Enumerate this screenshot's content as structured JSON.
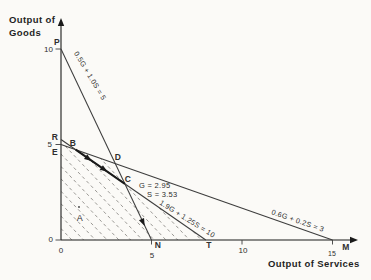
{
  "chart_data": {
    "type": "line",
    "title": "",
    "xlabel": "Output of Services",
    "ylabel_line1": "Output of",
    "ylabel_line2": "Goods",
    "xlim": [
      0,
      16
    ],
    "ylim": [
      0,
      11.5
    ],
    "x_ticks": [
      0,
      5,
      10,
      15
    ],
    "y_ticks": [
      0,
      5,
      10
    ],
    "grid": false,
    "constraint_lines": [
      {
        "name": "line-PN",
        "label": "0.5G + 1.0S = 5",
        "points": [
          [
            0,
            10
          ],
          [
            5,
            0
          ]
        ],
        "endpoint_labels": [
          "P",
          "N"
        ]
      },
      {
        "name": "line-RT",
        "label": "1.9G + 1.25S = 10",
        "points": [
          [
            0,
            5.263
          ],
          [
            8,
            0
          ]
        ],
        "endpoint_labels": [
          "R",
          "T"
        ]
      },
      {
        "name": "line-EM",
        "label": "0.6G + 0.2S = 3",
        "points": [
          [
            0,
            5
          ],
          [
            15,
            0
          ]
        ],
        "endpoint_labels": [
          "E",
          "M"
        ]
      }
    ],
    "key_points": [
      {
        "label": "P",
        "S": 0,
        "G": 10
      },
      {
        "label": "R",
        "S": 0,
        "G": 5.26
      },
      {
        "label": "E",
        "S": 0,
        "G": 5
      },
      {
        "label": "B",
        "S": 0.81,
        "G": 4.73
      },
      {
        "label": "D",
        "S": 3,
        "G": 4
      },
      {
        "label": "C",
        "S": 3.53,
        "G": 2.94,
        "note": "optimum"
      },
      {
        "label": "A",
        "S": 1.0,
        "G": 1.75
      },
      {
        "label": "N",
        "S": 5,
        "G": 0
      },
      {
        "label": "T",
        "S": 8,
        "G": 0
      },
      {
        "label": "M",
        "S": 15,
        "G": 0
      }
    ],
    "optimum_annotation": [
      "G = 2.95",
      "S = 3.53"
    ],
    "iso_profit_lines": {
      "slope": -1,
      "intercepts": [
        0.6,
        1.25,
        1.9,
        2.55,
        3.2,
        3.85,
        4.5,
        5.15,
        5.8,
        6.45,
        7.1,
        7.75
      ],
      "clip_region": [
        [
          0,
          5
        ],
        [
          3,
          4
        ],
        [
          3.53,
          2.94
        ],
        [
          8,
          0
        ],
        [
          0,
          0
        ]
      ]
    },
    "bold_segment": {
      "from": [
        0.81,
        4.73
      ],
      "to": [
        3.53,
        2.94
      ]
    }
  },
  "layout": {
    "width": 371,
    "height": 280,
    "colors": {
      "bg": "#fbfaf7",
      "ink": "#3d3d3d",
      "bold_ink": "#1a1a1a",
      "dash": "#8f8d89"
    },
    "origin": [
      61,
      240
    ],
    "scale": [
      18.1,
      19.1
    ],
    "axis_end": {
      "x": 351,
      "y": 25
    },
    "y_tick_entries": [
      {
        "label": "10",
        "G": 10,
        "lx": 53,
        "ly": 52
      },
      {
        "label": "5",
        "G": 5,
        "lx": 52,
        "ly": 147
      },
      {
        "label": "0",
        "G": 0,
        "lx": 53,
        "ly": 242
      }
    ],
    "x_tick_entries": [
      {
        "label": "0",
        "S": 0,
        "lx": 61,
        "ly": 253,
        "tick": false,
        "s": 8
      },
      {
        "label": "5",
        "S": 5,
        "lx": 152,
        "ly": 258,
        "tick": true,
        "s": 8
      },
      {
        "label": "10",
        "S": 10,
        "lx": 243,
        "ly": 253,
        "tick": true,
        "s": 8
      },
      {
        "label": "15",
        "S": 15,
        "lx": 332,
        "ly": 256,
        "tick": true,
        "s": 7
      }
    ],
    "texts": [
      {
        "t": "P",
        "x": 57,
        "y": 45,
        "w": "bold",
        "s": 8.5,
        "a": "middle",
        "name": "point-label-P"
      },
      {
        "t": "R",
        "x": 55,
        "y": 140,
        "w": "bold",
        "s": 8.5,
        "a": "middle",
        "name": "point-label-R"
      },
      {
        "t": "E",
        "x": 55,
        "y": 155,
        "w": "bold",
        "s": 8.5,
        "a": "middle",
        "name": "point-label-E"
      },
      {
        "t": "B",
        "x": 73,
        "y": 146,
        "w": "bold",
        "s": 8.5,
        "a": "middle",
        "name": "point-label-B"
      },
      {
        "t": "D",
        "x": 118,
        "y": 160,
        "w": "bold",
        "s": 8.5,
        "a": "middle",
        "name": "point-label-D"
      },
      {
        "t": "C",
        "x": 128,
        "y": 182,
        "w": "bold",
        "s": 8.5,
        "a": "middle",
        "name": "point-label-C"
      },
      {
        "t": "A",
        "x": 80,
        "y": 221,
        "w": "normal",
        "s": 9,
        "a": "middle",
        "name": "region-label-A"
      },
      {
        "t": "N",
        "x": 158,
        "y": 248,
        "w": "bold",
        "s": 8.5,
        "a": "middle",
        "name": "point-label-N"
      },
      {
        "t": "T",
        "x": 209,
        "y": 248,
        "w": "bold",
        "s": 8.5,
        "a": "middle",
        "name": "point-label-T"
      },
      {
        "t": "M",
        "x": 346,
        "y": 250,
        "w": "bold",
        "s": 8.5,
        "a": "middle",
        "name": "point-label-M"
      },
      {
        "t": "G = 2.95",
        "x": 139,
        "y": 188,
        "w": "normal",
        "s": 7.5,
        "a": "start",
        "name": "optimum-G-label"
      },
      {
        "t": "S = 3.53",
        "x": 147,
        "y": 197,
        "w": "normal",
        "s": 7.5,
        "a": "start",
        "name": "optimum-S-label"
      },
      {
        "t": "0.5G + 1.0S = 5",
        "x": 88,
        "y": 77,
        "w": "normal",
        "s": 7.2,
        "a": "middle",
        "rot": 59,
        "name": "line-label-PN"
      },
      {
        "t": "1.9G + 1.25S = 10",
        "x": 186,
        "y": 221,
        "w": "normal",
        "s": 7.2,
        "a": "middle",
        "rot": 32,
        "name": "line-label-RT"
      },
      {
        "t": "0.6G + 0.2S = 3",
        "x": 297,
        "y": 223,
        "w": "normal",
        "s": 7.2,
        "a": "middle",
        "rot": 19,
        "name": "line-label-EM"
      }
    ],
    "path_arrows": [
      {
        "x": 88.5,
        "y": 158.6,
        "rot": 34.7
      },
      {
        "x": 104.2,
        "y": 169.5,
        "rot": 34.7
      },
      {
        "x": 143.0,
        "y": 222.3,
        "rot": 64.6
      }
    ],
    "point_dot_A": {
      "x": 79,
      "y": 207
    }
  }
}
